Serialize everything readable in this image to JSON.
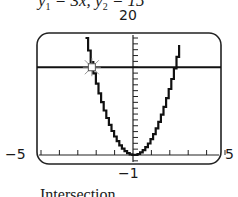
{
  "chart_data": {
    "type": "line",
    "series": [
      {
        "name": "y1",
        "expression": "3x^2"
      },
      {
        "name": "y2",
        "expression": "15"
      }
    ],
    "xlim": [
      -5,
      5
    ],
    "ylim": [
      -1,
      20
    ],
    "x_tick_labels": [
      "-5",
      "5"
    ],
    "y_tick_labels": [
      "-1",
      "20"
    ],
    "x_tick_step": 1,
    "y_tick_step": 1,
    "grid": false,
    "annotations": [
      {
        "type": "intersection-marker",
        "x": -2.236,
        "y": 15
      }
    ],
    "caption": "Intersection"
  },
  "labels": {
    "eqn_y1": "y",
    "eqn_y1_sub": "1",
    "eqn_y1_rhs": " = 3x",
    "eqn_sep": ", ",
    "eqn_y2": "y",
    "eqn_y2_sub": "2",
    "eqn_y2_rhs": " = 15",
    "ymax": "20",
    "ymin": "−1",
    "xmin": "−5",
    "xmax": "5",
    "caption": "Intersection"
  }
}
